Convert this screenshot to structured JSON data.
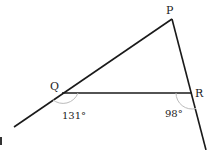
{
  "diagram": {
    "type": "triangle-exterior-angles",
    "points": {
      "P": {
        "label": "P",
        "x": 172,
        "y": 19
      },
      "Q": {
        "label": "Q",
        "x": 62,
        "y": 93
      },
      "R": {
        "label": "R",
        "x": 192,
        "y": 93
      }
    },
    "angles": {
      "Q_exterior": {
        "label": "131°"
      },
      "R_exterior": {
        "label": "98°"
      }
    },
    "colors": {
      "line": "#1a1a1a",
      "arc": "#bbbbbb",
      "text": "#222222"
    }
  }
}
